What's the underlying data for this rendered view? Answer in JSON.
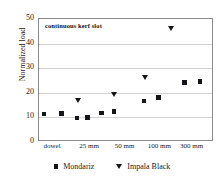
{
  "chart_data": {
    "type": "scatter",
    "title": "",
    "annotation": "continuous kerf slot",
    "xlabel": "",
    "ylabel": "Normalized load",
    "ylim": [
      0,
      50
    ],
    "yticks": [
      0,
      10,
      20,
      30,
      40,
      50
    ],
    "ytick_labels": [
      "0",
      "10",
      "20",
      "30",
      "40",
      "50"
    ],
    "categories": [
      "dowel",
      "25 mm",
      "50 mm",
      "100 mm",
      "300 mm"
    ],
    "grid": "horizontal",
    "legend_position": "bottom",
    "series": [
      {
        "name": "Mondariz",
        "marker": "square",
        "color": "#15151a",
        "points": [
          {
            "x": 0.3,
            "y": 11.3
          },
          {
            "x": 1.35,
            "y": 11.5
          },
          {
            "x": 2.3,
            "y": 9.7
          },
          {
            "x": 2.95,
            "y": 10.0
          },
          {
            "x": 3.8,
            "y": 11.8
          },
          {
            "x": 4.55,
            "y": 12.5
          },
          {
            "x": 6.35,
            "y": 16.7
          },
          {
            "x": 7.25,
            "y": 18.0
          },
          {
            "x": 8.8,
            "y": 24.2
          },
          {
            "x": 9.75,
            "y": 24.6
          }
        ]
      },
      {
        "name": "Impala Black",
        "marker": "triangle-down",
        "color": "#15151a",
        "points": [
          {
            "x": 2.4,
            "y": 16.8
          },
          {
            "x": 4.55,
            "y": 19.4
          },
          {
            "x": 6.45,
            "y": 26.0
          },
          {
            "x": 8.05,
            "y": 46.0
          }
        ]
      }
    ],
    "xcat_positions": [
      0.85,
      3.1,
      5.25,
      7.35,
      9.3
    ],
    "xrange": [
      0,
      10.6
    ]
  }
}
